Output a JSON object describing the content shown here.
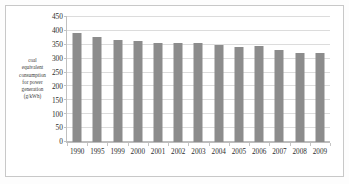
{
  "chart_data": {
    "type": "bar",
    "title": "",
    "xlabel": "",
    "ylabel": "coal equivalent consumption for power generation (g/kWh)",
    "ylabel_lines": [
      "coal",
      "equivalent",
      "consumption",
      "for power",
      "generation",
      "(g/kWh)"
    ],
    "categories": [
      "1990",
      "1995",
      "1999",
      "2000",
      "2001",
      "2002",
      "2003",
      "2004",
      "2005",
      "2006",
      "2007",
      "2008",
      "2009"
    ],
    "values": [
      392,
      379,
      369,
      363,
      357,
      356,
      355,
      349,
      343,
      344,
      332,
      322,
      320
    ],
    "ylim": [
      0,
      450
    ],
    "ytick_values": [
      0,
      50,
      100,
      150,
      200,
      250,
      300,
      350,
      400,
      450
    ],
    "ytick_labels": [
      "0",
      "50",
      "100",
      "150",
      "200",
      "250",
      "300",
      "350",
      "400",
      "450"
    ],
    "grid": true,
    "legend": false,
    "legend_position": "none",
    "series": [
      {
        "name": "coal equivalent consumption for power generation (g/kWh)",
        "values": [
          392,
          379,
          369,
          363,
          357,
          356,
          355,
          349,
          343,
          344,
          332,
          322,
          320
        ]
      }
    ],
    "colors": {
      "bar": "#8c8c8c",
      "gridline": "#dcdcdc",
      "axis": "#bdbdbd",
      "text": "#2d2d2d",
      "frame": "#c8c8c8",
      "background": "#ffffff"
    }
  }
}
